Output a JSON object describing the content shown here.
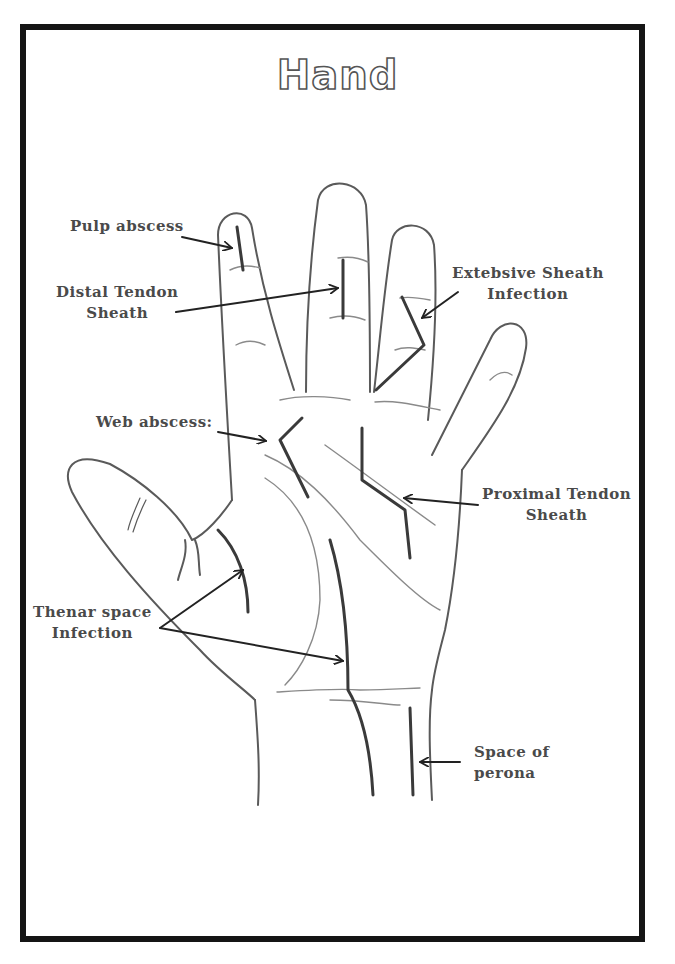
{
  "title": "Hand",
  "colors": {
    "frame": "#151515",
    "outline": "#555555",
    "infection_line": "#3a3a3a",
    "label_text": "#4a4a4a",
    "background": "#ffffff"
  },
  "labels": [
    {
      "id": "pulp-abscess",
      "lines": [
        "Pulp abscess"
      ]
    },
    {
      "id": "distal-tendon-sheath",
      "lines": [
        "Distal Tendon",
        "Sheath"
      ]
    },
    {
      "id": "extensive-sheath-infection",
      "lines": [
        "Extebsive Sheath",
        "Infection"
      ]
    },
    {
      "id": "web-abscess",
      "lines": [
        "Web abscess:"
      ]
    },
    {
      "id": "proximal-tendon-sheath",
      "lines": [
        "Proximal Tendon",
        "Sheath"
      ]
    },
    {
      "id": "thenar-space-infection",
      "lines": [
        "Thenar space",
        "Infection"
      ]
    },
    {
      "id": "space-of-perona",
      "lines": [
        "Space of",
        "perona"
      ]
    }
  ]
}
